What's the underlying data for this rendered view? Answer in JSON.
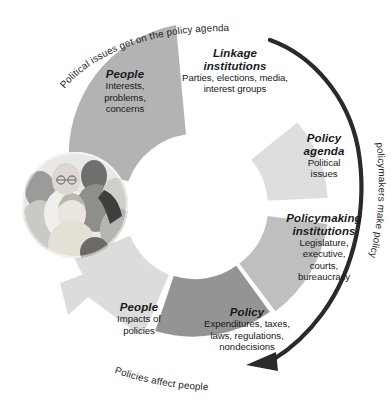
{
  "diagram": {
    "type": "cycle",
    "segments": [
      {
        "id": "people-top",
        "title": "People",
        "body": "Interests,\nproblems,\nconcerns",
        "body_lines": [
          "Interests,",
          "problems,",
          "concerns"
        ],
        "color": "#b3b3b3",
        "shade": "medium"
      },
      {
        "id": "linkage-institutions",
        "title": "Linkage\ninstitutions",
        "title_lines": [
          "Linkage",
          "institutions"
        ],
        "body": "Parties, elections, media,\ninterest groups",
        "body_lines": [
          "Parties, elections, media,",
          "interest groups"
        ],
        "color": "#ffffff",
        "shade": "none"
      },
      {
        "id": "policy-agenda",
        "title": "Policy\nagenda",
        "title_lines": [
          "Policy",
          "agenda"
        ],
        "body": "Political\nissues",
        "body_lines": [
          "Political",
          "issues"
        ],
        "color": "#dedede",
        "shade": "light"
      },
      {
        "id": "policymaking-institutions",
        "title": "Policymaking\ninstitutions",
        "title_lines": [
          "Policymaking",
          "institutions"
        ],
        "body": "Legislature,\nexecutive,\ncourts,\nbureaucracy",
        "body_lines": [
          "Legislature,",
          "executive,",
          "courts,",
          "bureaucracy"
        ],
        "color": "#bfbfbf",
        "shade": "medium"
      },
      {
        "id": "policy",
        "title": "Policy",
        "body": "Expenditures, taxes,\nlaws, regulations,\nnondecisions",
        "body_lines": [
          "Expenditures, taxes,",
          "laws, regulations,",
          "nondecisions"
        ],
        "color": "#949494",
        "shade": "dark"
      },
      {
        "id": "people-bottom",
        "title": "People",
        "body": "Impacts of\npolicies",
        "body_lines": [
          "Impacts of",
          "policies"
        ],
        "color": "#dcdcdc",
        "shade": "light"
      }
    ],
    "arrows": [
      {
        "id": "top-curve-caption",
        "label": "Political issues get on the policy agenda",
        "position": "top-left",
        "color": "#1d1d1f"
      },
      {
        "id": "right-curve-caption",
        "label": "policymakers make policy",
        "position": "right",
        "color": "#1d1d1f"
      },
      {
        "id": "bottom-curve-caption",
        "label": "Policies affect people",
        "position": "bottom-left",
        "color": "#1d1d1f"
      },
      {
        "id": "outer-dark-arrow",
        "label": "",
        "position": "outer-right",
        "color": "#2a2a2c"
      },
      {
        "id": "inner-grey-arrowhead",
        "label": "",
        "position": "lower-left",
        "color": "#dcdcdc"
      }
    ],
    "photo": {
      "id": "people-photo",
      "caption": "group of people",
      "shape": "circle"
    }
  }
}
